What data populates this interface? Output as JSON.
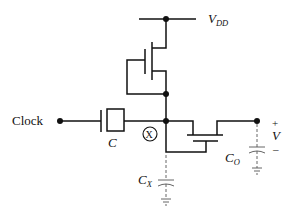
{
  "diagram": {
    "type": "circuit-schematic",
    "labels": {
      "supply": "V",
      "supply_sub": "DD",
      "clock": "Clock",
      "coupling_cap": "C",
      "node_x": "X",
      "cx": "C",
      "cx_sub": "X",
      "co": "C",
      "co_sub": "O",
      "output_v": "V",
      "plus": "+",
      "minus": "–"
    },
    "components": [
      {
        "id": "vdd-rail",
        "kind": "supply-rail"
      },
      {
        "id": "m1",
        "kind": "nmos-diode-connected",
        "between": [
          "VDD",
          "X"
        ]
      },
      {
        "id": "c",
        "kind": "capacitor",
        "between": [
          "Clock",
          "X"
        ]
      },
      {
        "id": "m2",
        "kind": "nmos-transfer",
        "between": [
          "X",
          "Out"
        ]
      },
      {
        "id": "cx",
        "kind": "parasitic-capacitor",
        "node": "X"
      },
      {
        "id": "co",
        "kind": "parasitic-capacitor",
        "node": "Out"
      }
    ]
  }
}
